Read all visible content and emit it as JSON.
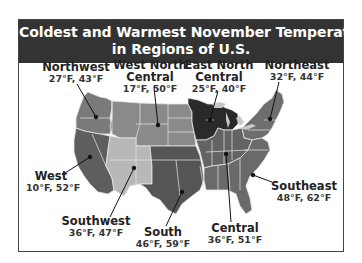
{
  "title": {
    "line1": "Coldest and Warmest November Temperatures",
    "line2": "in Regions of U.S."
  },
  "colors": {
    "title_band": "#333333",
    "northwest": "#7a7a7a",
    "west_north_central": "#8a8a8a",
    "east_north_central": "#2a2a2a",
    "northeast": "#6e6e6e",
    "west": "#5e5e5e",
    "southwest": "#b8b8b8",
    "south": "#555555",
    "central": "#636363",
    "southeast": "#6a6a6a",
    "state_borders": "#e6e6e6"
  },
  "regions": [
    {
      "id": "northwest",
      "name_line1": "Northwest",
      "name_line2": "",
      "temps": "27°F, 43°F"
    },
    {
      "id": "west_north_central",
      "name_line1": "West North",
      "name_line2": "Central",
      "temps": "17°F, 50°F"
    },
    {
      "id": "east_north_central",
      "name_line1": "East North",
      "name_line2": "Central",
      "temps": "25°F, 40°F"
    },
    {
      "id": "northeast",
      "name_line1": "Northeast",
      "name_line2": "",
      "temps": "32°F, 44°F"
    },
    {
      "id": "west",
      "name_line1": "West",
      "name_line2": "",
      "temps": "10°F, 52°F"
    },
    {
      "id": "southwest",
      "name_line1": "Southwest",
      "name_line2": "",
      "temps": "36°F, 47°F"
    },
    {
      "id": "south",
      "name_line1": "South",
      "name_line2": "",
      "temps": "46°F, 59°F"
    },
    {
      "id": "central",
      "name_line1": "Central",
      "name_line2": "",
      "temps": "36°F, 51°F"
    },
    {
      "id": "southeast",
      "name_line1": "Southeast",
      "name_line2": "",
      "temps": "48°F, 62°F"
    }
  ]
}
